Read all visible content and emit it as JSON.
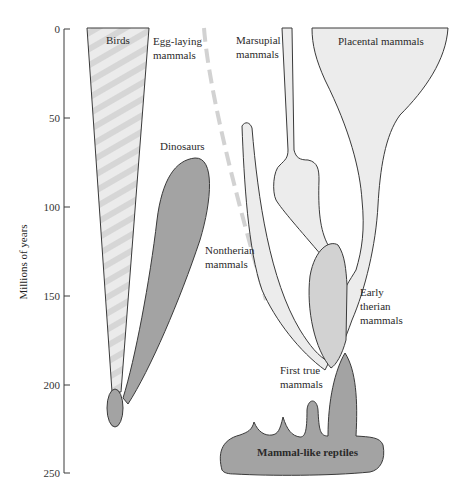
{
  "axis": {
    "title": "Millions of years",
    "ticks": [
      "0",
      "50",
      "100",
      "150",
      "200",
      "250"
    ]
  },
  "groups": {
    "birds": "Birds",
    "egg_laying_1": "Egg-laying",
    "egg_laying_2": "mammals",
    "dinosaurs": "Dinosaurs",
    "marsupial_1": "Marsupial",
    "marsupial_2": "mammals",
    "placental": "Placental mammals",
    "nontherian_1": "Nontherian",
    "nontherian_2": "mammals",
    "early_therian_1": "Early",
    "early_therian_2": "therian",
    "early_therian_3": "mammals",
    "first_true_1": "First true",
    "first_true_2": "mammals",
    "mammal_like_reptiles": "Mammal-like reptiles"
  },
  "colors": {
    "dark_fill": "#a3a3a3",
    "light_fill": "#ececec",
    "medium_fill": "#d2d2d2",
    "stroke": "#3a3a3a",
    "dashed_line": "#d0d0d0"
  }
}
